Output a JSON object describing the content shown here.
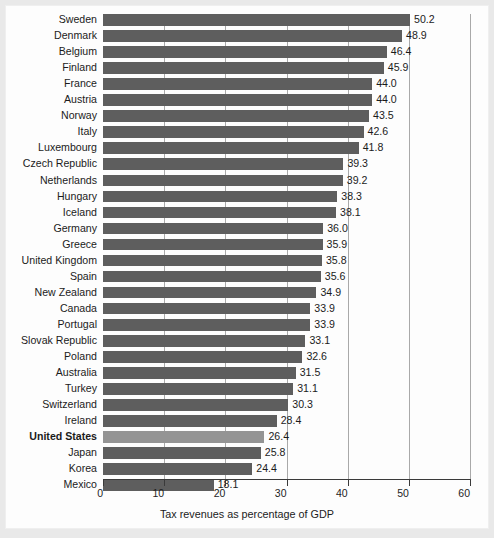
{
  "chart_data": {
    "type": "bar",
    "orientation": "horizontal",
    "title": "",
    "xlabel": "Tax revenues as percentage of GDP",
    "ylabel": "",
    "xlim": [
      0,
      60
    ],
    "xticks": [
      "0",
      "10",
      "20",
      "30",
      "40",
      "50",
      "60"
    ],
    "grid": true,
    "legend": "none",
    "highlight_category": "United States",
    "colors": {
      "bar": "#5e5e5e",
      "bar_highlight": "#949494",
      "gridline": "#a9a9a9",
      "axis": "#3a3a3a",
      "text": "#1b1b1b",
      "panel_background": "#fdfdfd",
      "page_background": "#e9e9e9"
    },
    "categories": [
      "Sweden",
      "Denmark",
      "Belgium",
      "Finland",
      "France",
      "Austria",
      "Norway",
      "Italy",
      "Luxembourg",
      "Czech Republic",
      "Netherlands",
      "Hungary",
      "Iceland",
      "Germany",
      "Greece",
      "United Kingdom",
      "Spain",
      "New Zealand",
      "Canada",
      "Portugal",
      "Slovak Republic",
      "Poland",
      "Australia",
      "Turkey",
      "Switzerland",
      "Ireland",
      "United States",
      "Japan",
      "Korea",
      "Mexico"
    ],
    "values": [
      50.2,
      48.9,
      46.4,
      45.9,
      44.0,
      44.0,
      43.5,
      42.6,
      41.8,
      39.3,
      39.2,
      38.3,
      38.1,
      36.0,
      35.9,
      35.8,
      35.6,
      34.9,
      33.9,
      33.9,
      33.1,
      32.6,
      31.5,
      31.1,
      30.3,
      28.4,
      26.4,
      25.8,
      24.4,
      18.1
    ],
    "value_labels": [
      "50.2",
      "48.9",
      "46.4",
      "45.9",
      "44.0",
      "44.0",
      "43.5",
      "42.6",
      "41.8",
      "39.3",
      "39.2",
      "38.3",
      "38.1",
      "36.0",
      "35.9",
      "35.8",
      "35.6",
      "34.9",
      "33.9",
      "33.9",
      "33.1",
      "32.6",
      "31.5",
      "31.1",
      "30.3",
      "28.4",
      "26.4",
      "25.8",
      "24.4",
      "18.1"
    ]
  }
}
